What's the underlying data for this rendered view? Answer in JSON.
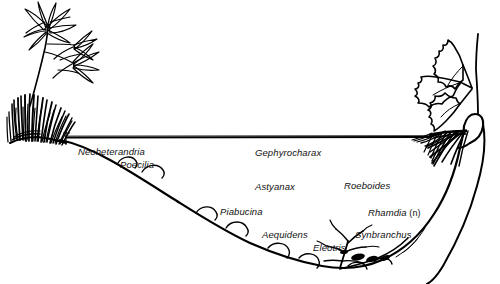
{
  "figure": {
    "kind": "stream-cross-section-illustration",
    "background_color": "#ffffff",
    "ink_color": "#000000",
    "width": 500,
    "height": 284
  },
  "water": {
    "surface_label": "water-surface-line",
    "surface_y": 137
  },
  "taxa": [
    {
      "name": "Neoheterandria",
      "qualifier": "",
      "x": 78,
      "y": 147
    },
    {
      "name": "Poecilia",
      "qualifier": "",
      "x": 120,
      "y": 160
    },
    {
      "name": "Gephyrocharax",
      "qualifier": "",
      "x": 255,
      "y": 148
    },
    {
      "name": "Astyanax",
      "qualifier": "",
      "x": 255,
      "y": 182
    },
    {
      "name": "Roeboides",
      "qualifier": "",
      "x": 344,
      "y": 181
    },
    {
      "name": "Piabucina",
      "qualifier": "",
      "x": 220,
      "y": 207
    },
    {
      "name": "Rhamdia",
      "qualifier": " (n)",
      "x": 368,
      "y": 208
    },
    {
      "name": "Aequidens",
      "qualifier": "",
      "x": 262,
      "y": 230
    },
    {
      "name": "Eleotris",
      "qualifier": "",
      "x": 313,
      "y": 243
    },
    {
      "name": "Synbranchus",
      "qualifier": "",
      "x": 355,
      "y": 230
    }
  ],
  "vegetation": {
    "left_plant": "narrow-leaved-emergent-plant",
    "left_grass": "grass-tuft-clump",
    "right_plant": "lobed-leaf-shrub",
    "right_roots": "submerged-root-mass",
    "bottom_debris": "submerged-branch-debris"
  },
  "substrate": {
    "left_bank": "sloping-gravel-bank",
    "right_bank": "steep-undercut-bank",
    "bed_stones": "rounded-bed-stones"
  }
}
